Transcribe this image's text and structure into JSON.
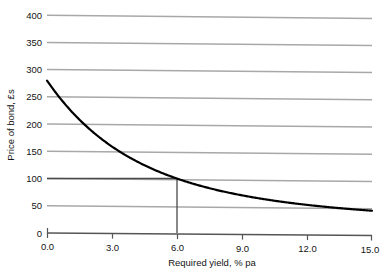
{
  "chart_data": {
    "type": "line",
    "title": "",
    "subtitle": "",
    "xlabel": "Required yield, % pa",
    "ylabel": "Price of bond, £s",
    "xlim": [
      0.0,
      15.0
    ],
    "ylim": [
      0,
      400
    ],
    "grid": true,
    "legend": null,
    "legend_position": "none",
    "x_ticks": [
      "0.0",
      "3.0",
      "6.0",
      "9.0",
      "12.0",
      "15.0"
    ],
    "x_tick_values": [
      0.0,
      3.0,
      6.0,
      9.0,
      12.0,
      15.0
    ],
    "y_ticks": [
      "0",
      "50",
      "100",
      "150",
      "200",
      "250",
      "300",
      "350",
      "400"
    ],
    "y_tick_values": [
      0,
      50,
      100,
      150,
      200,
      250,
      300,
      350,
      400
    ],
    "series": [
      {
        "name": "Price of bond",
        "color": "#000000",
        "x": [
          0.0,
          0.5,
          1.0,
          1.5,
          2.0,
          2.5,
          3.0,
          3.5,
          4.0,
          4.5,
          5.0,
          5.5,
          6.0,
          6.5,
          7.0,
          7.5,
          8.0,
          8.5,
          9.0,
          9.5,
          10.0,
          10.5,
          11.0,
          11.5,
          12.0,
          12.5,
          13.0,
          13.5,
          14.0,
          14.5,
          15.0
        ],
        "values": [
          340,
          315,
          292,
          272,
          253,
          236,
          220,
          206,
          193,
          181,
          170,
          160,
          100,
          143,
          136,
          129,
          122,
          116,
          110,
          105,
          100,
          95,
          91,
          87,
          83,
          79,
          76,
          73,
          70,
          67,
          64
        ]
      }
    ],
    "annotations": [
      {
        "name": "par-price-marker",
        "type": "crosshair",
        "x": 6.0,
        "y": 100,
        "label": ""
      }
    ]
  },
  "axes": {
    "y_axis_label": "Price of bond, £s",
    "x_axis_label": "Required yield, % pa"
  },
  "colors": {
    "curve": "#000000",
    "gridline": "#a8a8a8",
    "gridline_highlight": "#4a4a4a",
    "axis": "#555555",
    "annotation": "#555555",
    "text": "#141414",
    "background": "#ffffff"
  }
}
